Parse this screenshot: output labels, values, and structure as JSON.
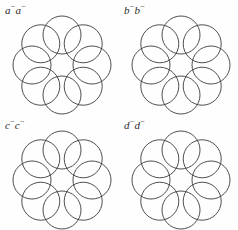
{
  "figure": {
    "background_color": "#fefefe",
    "stroke_color": "#3a3a3a",
    "fill_color": "#ffffff",
    "panel_width": 119,
    "panel_height": 115,
    "columns": 2,
    "rows": 2
  },
  "panels": [
    {
      "id": "panel-a",
      "position": "top-left",
      "label_letter": "a",
      "label_sign": "−",
      "label_text": "a−a−",
      "ring": {
        "circle_count": 8,
        "circle_radius": 19,
        "ring_radius": 30,
        "center_x": 62,
        "center_y": 65,
        "start_angle_deg": -90
      }
    },
    {
      "id": "panel-b",
      "position": "top-right",
      "label_letter": "b",
      "label_sign": "−",
      "label_text": "b−b−",
      "ring": {
        "circle_count": 8,
        "circle_radius": 19,
        "ring_radius": 30,
        "center_x": 62,
        "center_y": 65,
        "start_angle_deg": -90
      }
    },
    {
      "id": "panel-c",
      "position": "bottom-left",
      "label_letter": "c",
      "label_sign": "−",
      "label_text": "c−c−",
      "ring": {
        "circle_count": 8,
        "circle_radius": 19,
        "ring_radius": 30,
        "center_x": 62,
        "center_y": 65,
        "start_angle_deg": -90
      }
    },
    {
      "id": "panel-d",
      "position": "bottom-right",
      "label_letter": "d",
      "label_sign": "−",
      "label_text": "d−d−",
      "ring": {
        "circle_count": 8,
        "circle_radius": 19,
        "ring_radius": 30,
        "center_x": 62,
        "center_y": 65,
        "start_angle_deg": -90
      }
    }
  ]
}
